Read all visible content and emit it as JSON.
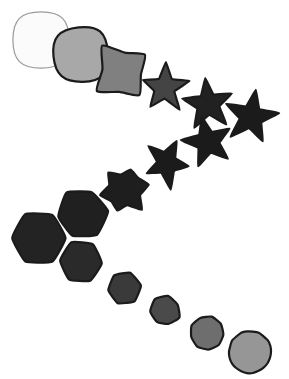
{
  "figure": {
    "width": 289,
    "height": 379,
    "background": "#ffffff"
  },
  "palette": {
    "background": "#ffffff",
    "outline_dark": "#111111",
    "outline_light": "#9a9a9a",
    "lightest_fill": "#fbfbfb",
    "darkest_fill": "#1b1b1b"
  },
  "chart_data": {
    "type": "scatter",
    "xlabel": "",
    "ylabel": "",
    "grid": false,
    "legend": null,
    "xlim": [
      0,
      289
    ],
    "ylim": [
      0,
      379
    ],
    "series": [
      {
        "name": "morph-path",
        "points": [
          {
            "index": 0,
            "x": 41,
            "y": 40,
            "size": 47,
            "gray": 251,
            "fill": "#fbfbfb",
            "stroke": "#9a9a9a",
            "shape": "square",
            "jitter": 0.0,
            "rotation": 0
          },
          {
            "index": 1,
            "x": 80,
            "y": 55,
            "size": 46,
            "gray": 168,
            "fill": "#a8a8a8",
            "stroke": "#1b1b1b",
            "shape": "square",
            "jitter": 0.07,
            "rotation": -4
          },
          {
            "index": 2,
            "x": 122,
            "y": 72,
            "size": 48,
            "gray": 128,
            "fill": "#808080",
            "stroke": "#1b1b1b",
            "shape": "star4",
            "jitter": 0.09,
            "rotation": 8
          },
          {
            "index": 3,
            "x": 165,
            "y": 88,
            "size": 50,
            "gray": 68,
            "fill": "#444444",
            "stroke": "#1b1b1b",
            "shape": "star5",
            "jitter": 0.08,
            "rotation": 2
          },
          {
            "index": 4,
            "x": 208,
            "y": 104,
            "size": 53,
            "gray": 33,
            "fill": "#212121",
            "stroke": "#1b1b1b",
            "shape": "star5",
            "jitter": 0.06,
            "rotation": -6
          },
          {
            "index": 5,
            "x": 251,
            "y": 117,
            "size": 56,
            "gray": 27,
            "fill": "#1b1b1b",
            "stroke": "#1b1b1b",
            "shape": "star5",
            "jitter": 0.04,
            "rotation": 10
          },
          {
            "index": 6,
            "x": 208,
            "y": 142,
            "size": 52,
            "gray": 27,
            "fill": "#1b1b1b",
            "stroke": "#1b1b1b",
            "shape": "star5",
            "jitter": 0.06,
            "rotation": -14
          },
          {
            "index": 7,
            "x": 166,
            "y": 163,
            "size": 49,
            "gray": 27,
            "fill": "#1b1b1b",
            "stroke": "#1b1b1b",
            "shape": "star5",
            "jitter": 0.14,
            "rotation": 26
          },
          {
            "index": 8,
            "x": 124,
            "y": 190,
            "size": 47,
            "gray": 30,
            "fill": "#1e1e1e",
            "stroke": "#1b1b1b",
            "shape": "hexstar",
            "jitter": 0.12,
            "rotation": 18
          },
          {
            "index": 9,
            "x": 82,
            "y": 214,
            "size": 49,
            "gray": 32,
            "fill": "#202020",
            "stroke": "#1b1b1b",
            "shape": "hexagon",
            "jitter": 0.06,
            "rotation": -6
          },
          {
            "index": 10,
            "x": 39,
            "y": 238,
            "size": 53,
            "gray": 35,
            "fill": "#232323",
            "stroke": "#1b1b1b",
            "shape": "hexagon",
            "jitter": 0.02,
            "rotation": 0
          },
          {
            "index": 11,
            "x": 81,
            "y": 262,
            "size": 42,
            "gray": 42,
            "fill": "#2a2a2a",
            "stroke": "#1b1b1b",
            "shape": "hexagon",
            "jitter": 0.03,
            "rotation": 4
          },
          {
            "index": 12,
            "x": 124,
            "y": 288,
            "size": 32,
            "gray": 58,
            "fill": "#3a3a3a",
            "stroke": "#1b1b1b",
            "shape": "hexagon",
            "jitter": 0.05,
            "rotation": -8
          },
          {
            "index": 13,
            "x": 165,
            "y": 311,
            "size": 29,
            "gray": 74,
            "fill": "#4a4a4a",
            "stroke": "#1b1b1b",
            "shape": "heptagon",
            "jitter": 0.1,
            "rotation": 14
          },
          {
            "index": 14,
            "x": 207,
            "y": 333,
            "size": 33,
            "gray": 110,
            "fill": "#6e6e6e",
            "stroke": "#1b1b1b",
            "shape": "nonagon",
            "jitter": 0.05,
            "rotation": 6
          },
          {
            "index": 15,
            "x": 250,
            "y": 352,
            "size": 42,
            "gray": 150,
            "fill": "#969696",
            "stroke": "#1b1b1b",
            "shape": "circle",
            "jitter": 0.02,
            "rotation": 0
          }
        ]
      }
    ]
  }
}
